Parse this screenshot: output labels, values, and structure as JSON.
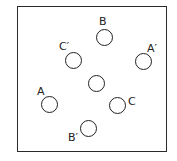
{
  "diagram": {
    "frame": {
      "shape": "square"
    },
    "circles": [
      {
        "id": "B",
        "label": "B",
        "cx": 104,
        "cy": 37,
        "lx": 99,
        "ly": 16
      },
      {
        "id": "C_prime",
        "label": "C′",
        "cx": 73,
        "cy": 60,
        "lx": 59,
        "ly": 41
      },
      {
        "id": "A_prime",
        "label": "A′",
        "cx": 143,
        "cy": 61,
        "lx": 147,
        "ly": 43
      },
      {
        "id": "center",
        "label": "",
        "cx": 96,
        "cy": 83
      },
      {
        "id": "A",
        "label": "A",
        "cx": 49,
        "cy": 104,
        "lx": 37,
        "ly": 86
      },
      {
        "id": "C",
        "label": "C",
        "cx": 117,
        "cy": 105,
        "lx": 128,
        "ly": 96
      },
      {
        "id": "B_prime",
        "label": "B′",
        "cx": 88,
        "cy": 128,
        "lx": 68,
        "ly": 132
      }
    ]
  }
}
